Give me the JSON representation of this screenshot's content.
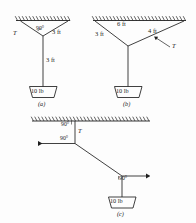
{
  "figure": {
    "title_style": "statics-rope-tension-diagrams",
    "ink_color": "#1f1f1f",
    "background_color": "#fdfdfd"
  },
  "panels": [
    {
      "id": "a",
      "caption": "(a)",
      "weight_label": "10 lb",
      "angle_label": "90°",
      "tension_label": "T",
      "length_label_diagonal": "3 ft",
      "length_label_vertical": "3 ft"
    },
    {
      "id": "b",
      "caption": "(b)",
      "weight_label": "10 lb",
      "span_label": "6 ft",
      "left_leg_label": "3 ft",
      "right_leg_label": "4 ft",
      "tension_label": "T"
    },
    {
      "id": "c",
      "caption": "(c)",
      "weight_label": "10 lb",
      "tension_label": "T",
      "angle_top_label": "90°",
      "angle_left_label": "90°",
      "angle_lower_label": "90°"
    }
  ]
}
